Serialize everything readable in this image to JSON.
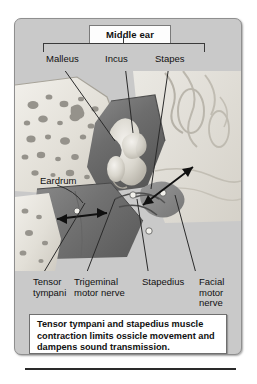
{
  "figure": {
    "title": "Middle ear",
    "caption": "Tensor tympani and stapedius muscle contraction limits ossicle movement and dampens sound transmission."
  },
  "ossicle_labels": [
    {
      "id": "malleus",
      "text": "Malleus"
    },
    {
      "id": "incus",
      "text": "Incus"
    },
    {
      "id": "stapes",
      "text": "Stapes"
    }
  ],
  "structure_labels": [
    {
      "id": "eardrum",
      "text": "Eardrum"
    }
  ],
  "muscle_nerve_labels": [
    {
      "id": "tensor-tympani",
      "text": "Tensor\ntympani"
    },
    {
      "id": "trigeminal-motor-nerve",
      "text": "Trigeminal\nmotor nerve"
    },
    {
      "id": "stapedius",
      "text": "Stapedius"
    },
    {
      "id": "facial-motor-nerve",
      "text": "Facial\nmotor\nnerve"
    }
  ],
  "colors": {
    "panel_background": "#c9c9c9",
    "panel_border": "#8f8f8f",
    "title_box_background": "#fdfdfd",
    "caption_background": "#ffffff",
    "label_text": "#111111",
    "leader_line": "#2a2a2a",
    "bone_light": "#e6e3dd",
    "bone_mid": "#cfcabf",
    "cavity_dark": "#6e6e6e",
    "ossicle_light": "#d8d5cd",
    "arrow": "#101010"
  }
}
